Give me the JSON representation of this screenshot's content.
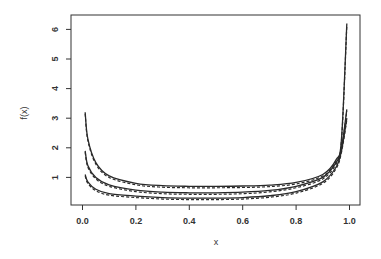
{
  "chart_data": {
    "type": "line",
    "title": "",
    "xlabel": "x",
    "ylabel": "f(x)",
    "xlim": [
      0.0,
      1.0
    ],
    "ylim": [
      0,
      6.3
    ],
    "grid": false,
    "legend": null,
    "x_ticks": [
      "0.0",
      "0.2",
      "0.4",
      "0.6",
      "0.8",
      "1.0"
    ],
    "y_ticks": [
      "1",
      "2",
      "3",
      "4",
      "5",
      "6"
    ],
    "x": [
      0.01,
      0.02,
      0.05,
      0.1,
      0.2,
      0.3,
      0.4,
      0.5,
      0.6,
      0.7,
      0.8,
      0.9,
      0.95,
      0.97,
      0.99
    ],
    "series": [
      {
        "name": "curve-1",
        "style": "solid+dashed",
        "values": [
          3.2,
          2.3,
          1.5,
          1.05,
          0.8,
          0.72,
          0.7,
          0.7,
          0.71,
          0.74,
          0.83,
          1.1,
          1.6,
          2.3,
          6.2
        ]
      },
      {
        "name": "curve-2",
        "style": "solid+dashed",
        "values": [
          1.9,
          1.4,
          1.0,
          0.75,
          0.57,
          0.5,
          0.48,
          0.48,
          0.5,
          0.56,
          0.7,
          1.0,
          1.5,
          2.0,
          3.3
        ]
      },
      {
        "name": "curve-3",
        "style": "solid+dashed",
        "values": [
          1.1,
          0.85,
          0.6,
          0.45,
          0.37,
          0.32,
          0.3,
          0.3,
          0.32,
          0.38,
          0.52,
          0.85,
          1.35,
          1.9,
          3.0
        ]
      }
    ]
  },
  "axes": {
    "xlabel": "x",
    "ylabel": "f(x)"
  }
}
